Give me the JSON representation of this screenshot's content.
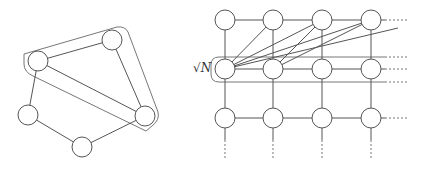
{
  "left_graph": {
    "nodes": [
      {
        "id": "A",
        "cx": 38,
        "cy": 61
      },
      {
        "id": "B",
        "cx": 112,
        "cy": 40
      },
      {
        "id": "C",
        "cx": 145,
        "cy": 116
      },
      {
        "id": "D",
        "cx": 28,
        "cy": 115
      },
      {
        "id": "E",
        "cx": 82,
        "cy": 147
      }
    ],
    "radius": 10,
    "edges": [
      [
        "A",
        "B"
      ],
      [
        "B",
        "C"
      ],
      [
        "A",
        "C"
      ],
      [
        "A",
        "D"
      ],
      [
        "D",
        "E"
      ],
      [
        "E",
        "C"
      ]
    ],
    "hull_nodes": [
      "A",
      "B",
      "C"
    ]
  },
  "grid_graph": {
    "columns_x": [
      225,
      273,
      322,
      371
    ],
    "rows_y": [
      20,
      69,
      118
    ],
    "radius": 10,
    "highlighted_row": 1,
    "row_label": "√N",
    "long_edges": [
      {
        "from": [
          225,
          69
        ],
        "to": [
          273,
          20
        ]
      },
      {
        "from": [
          225,
          69
        ],
        "to": [
          322,
          20
        ]
      },
      {
        "from": [
          225,
          69
        ],
        "to": [
          371,
          20
        ]
      },
      {
        "from": [
          225,
          69
        ],
        "to": [
          398,
          28
        ]
      },
      {
        "from": [
          273,
          69
        ],
        "to": [
          322,
          20
        ]
      },
      {
        "from": [
          273,
          69
        ],
        "to": [
          371,
          20
        ]
      }
    ],
    "continuation": "dotted"
  }
}
